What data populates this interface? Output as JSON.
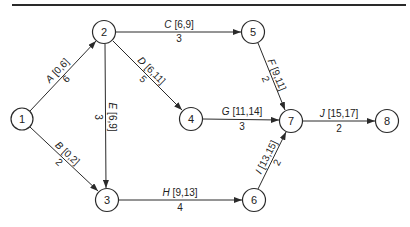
{
  "diagram": {
    "type": "activity-on-arrow network",
    "colors": {
      "line": "#2a2a2a",
      "background": "#ffffff"
    },
    "nodes": [
      {
        "id": "1",
        "label": "1",
        "x": 22,
        "y": 119
      },
      {
        "id": "2",
        "label": "2",
        "x": 104,
        "y": 32
      },
      {
        "id": "3",
        "label": "3",
        "x": 107,
        "y": 200
      },
      {
        "id": "4",
        "label": "4",
        "x": 191,
        "y": 119
      },
      {
        "id": "5",
        "label": "5",
        "x": 253,
        "y": 32
      },
      {
        "id": "6",
        "label": "6",
        "x": 254,
        "y": 200
      },
      {
        "id": "7",
        "label": "7",
        "x": 291,
        "y": 121
      },
      {
        "id": "8",
        "label": "8",
        "x": 387,
        "y": 121
      }
    ],
    "edges": [
      {
        "activity": "A",
        "range": "[0,6]",
        "duration": "6",
        "from": "1",
        "to": "2"
      },
      {
        "activity": "B",
        "range": "[0,2]",
        "duration": "2",
        "from": "1",
        "to": "3"
      },
      {
        "activity": "C",
        "range": "[6,9]",
        "duration": "3",
        "from": "2",
        "to": "5"
      },
      {
        "activity": "D",
        "range": "[6,11]",
        "duration": "5",
        "from": "2",
        "to": "4"
      },
      {
        "activity": "E",
        "range": "[6,9]",
        "duration": "3",
        "from": "2",
        "to": "3"
      },
      {
        "activity": "F",
        "range": "[9,11]",
        "duration": "2",
        "from": "5",
        "to": "7"
      },
      {
        "activity": "G",
        "range": "[11,14]",
        "duration": "3",
        "from": "4",
        "to": "7"
      },
      {
        "activity": "H",
        "range": "[9,13]",
        "duration": "4",
        "from": "3",
        "to": "6"
      },
      {
        "activity": "I",
        "range": "[13,15]",
        "duration": "2",
        "from": "6",
        "to": "7"
      },
      {
        "activity": "J",
        "range": "[15,17]",
        "duration": "2",
        "from": "7",
        "to": "8"
      }
    ]
  }
}
